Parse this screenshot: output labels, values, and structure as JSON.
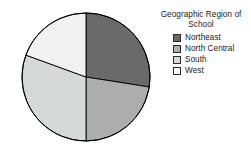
{
  "chart_data": {
    "type": "pie",
    "title": "Geographic Region of School",
    "legend_position": "right",
    "categories": [
      "Northeast",
      "North Central",
      "South",
      "West"
    ],
    "values": [
      27,
      26,
      30,
      17
    ],
    "slice_colors": [
      "#6a6a6a",
      "#adadad",
      "#d6dad7",
      "#f1f1f1"
    ],
    "start_angle_deg": 0,
    "direction": "clockwise",
    "outline_color": "#000000",
    "xlabel": "",
    "ylabel": "",
    "grid": false
  },
  "legend": {
    "title": "Geographic Region of\nSchool",
    "items": [
      {
        "label": "Northeast",
        "color": "#6a6a6a"
      },
      {
        "label": "North Central",
        "color": "#adadad"
      },
      {
        "label": "South",
        "color": "#d6dad7"
      },
      {
        "label": "West",
        "color": "#fbfbfb"
      }
    ]
  },
  "pie": {
    "center_x": 68,
    "center_y": 68,
    "radius": 64,
    "slices": [
      {
        "name": "Northeast",
        "start": 0,
        "end": 99,
        "color": "#6a6a6a"
      },
      {
        "name": "North Central",
        "start": 99,
        "end": 180,
        "color": "#adadad"
      },
      {
        "name": "South",
        "start": 180,
        "end": 290,
        "color": "#d6dad7"
      },
      {
        "name": "West",
        "start": 290,
        "end": 360,
        "color": "#f1f1f1"
      }
    ]
  }
}
